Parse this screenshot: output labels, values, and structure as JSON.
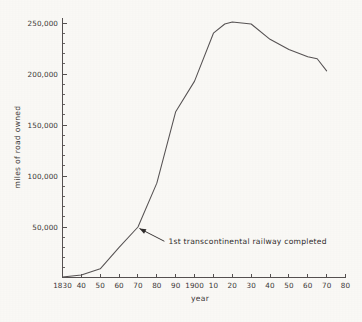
{
  "chart_data": {
    "type": "line",
    "title": "",
    "subtitle": "",
    "xlabel": "year",
    "ylabel": "miles of road owned",
    "xlim": [
      1830,
      1980
    ],
    "ylim": [
      0,
      260000
    ],
    "grid": false,
    "legend_position": "none",
    "x_tick_labels": [
      "1830",
      "40",
      "50",
      "60",
      "70",
      "80",
      "90",
      "1900",
      "10",
      "20",
      "30",
      "40",
      "50",
      "60",
      "70",
      "80"
    ],
    "x_tick_values": [
      1830,
      1840,
      1850,
      1860,
      1870,
      1880,
      1890,
      1900,
      1910,
      1920,
      1930,
      1940,
      1950,
      1960,
      1970,
      1980
    ],
    "y_tick_labels": [
      "50,000",
      "100,000",
      "150,000",
      "200,000",
      "250,000"
    ],
    "y_tick_values": [
      50000,
      100000,
      150000,
      200000,
      250000
    ],
    "y_minor_step": 10000,
    "series": [
      {
        "name": "miles of road owned",
        "color": "#565253",
        "x": [
          1830,
          1840,
          1850,
          1860,
          1870,
          1880,
          1890,
          1900,
          1910,
          1916,
          1920,
          1925,
          1930,
          1940,
          1950,
          1960,
          1965,
          1970
        ],
        "values": [
          1000,
          3000,
          9000,
          30000,
          50000,
          93000,
          163000,
          193000,
          240000,
          249000,
          251000,
          250000,
          249000,
          234000,
          224000,
          217000,
          215000,
          203000
        ]
      }
    ],
    "annotations": [
      {
        "text": "1st transcontinental railway completed",
        "target_x": 1870,
        "target_y": 50000,
        "label_x": 1884,
        "label_y": 36000
      }
    ]
  },
  "axes": {
    "y_axis_title": "miles of road owned",
    "x_axis_title": "year"
  }
}
